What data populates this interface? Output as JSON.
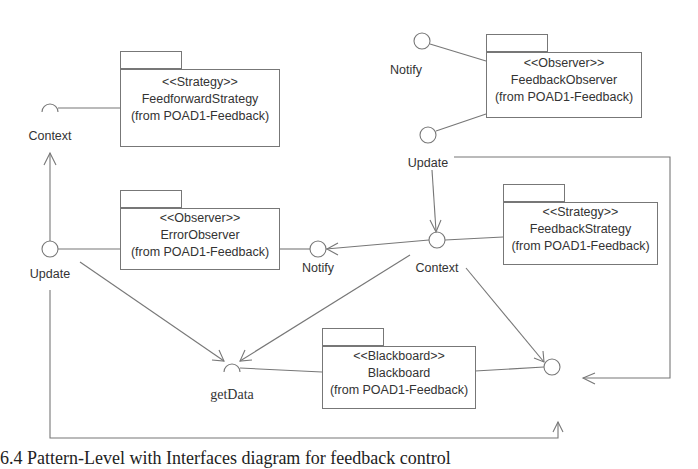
{
  "packages": {
    "feedforward_strategy": {
      "stereotype": "<<Strategy>>",
      "name": "FeedforwardStrategy",
      "origin": "(from POAD1-Feedback)"
    },
    "feedback_observer": {
      "stereotype": "<<Observer>>",
      "name": "FeedbackObserver",
      "origin": "(from POAD1-Feedback)"
    },
    "error_observer": {
      "stereotype": "<<Observer>>",
      "name": "ErrorObserver",
      "origin": "(from POAD1-Feedback)"
    },
    "feedback_strategy": {
      "stereotype": "<<Strategy>>",
      "name": "FeedbackStrategy",
      "origin": "(from POAD1-Feedback)"
    },
    "blackboard": {
      "stereotype": "<<Blackboard>>",
      "name": "Blackboard",
      "origin": "(from POAD1-Feedback)"
    }
  },
  "interfaces": {
    "ff_context": "Context",
    "fo_notify": "Notify",
    "fo_update": "Update",
    "eo_update": "Update",
    "eo_notify": "Notify",
    "fs_context": "Context",
    "bb_getdata": "getData"
  },
  "caption": "6.4 Pattern-Level with Interfaces diagram for feedback control"
}
